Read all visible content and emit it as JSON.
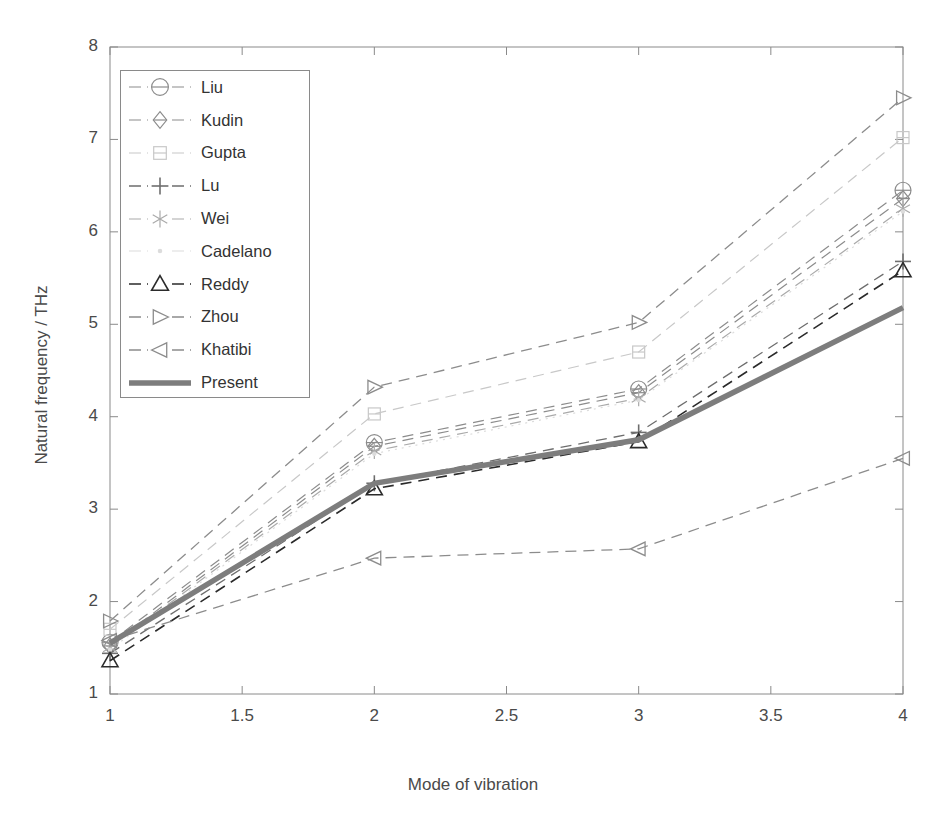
{
  "chart_data": {
    "type": "line",
    "title": "",
    "xlabel": "Mode of vibration",
    "ylabel": "Natural frequency / THz",
    "x": [
      1,
      2,
      3,
      4
    ],
    "xlim": [
      1,
      4
    ],
    "ylim": [
      1,
      8
    ],
    "xticks": [
      1,
      1.5,
      2,
      2.5,
      3,
      3.5,
      4
    ],
    "xticklabels": [
      "1",
      "1.5",
      "2",
      "2.5",
      "3",
      "3.5",
      "4"
    ],
    "yticks": [
      1,
      2,
      3,
      4,
      5,
      6,
      7,
      8
    ],
    "yticklabels": [
      "1",
      "2",
      "3",
      "4",
      "5",
      "6",
      "7",
      "8"
    ],
    "grid": false,
    "legend_position": "upper left",
    "series": [
      {
        "name": "Liu",
        "marker": "circle",
        "linestyle": "dashed",
        "color": "#8c8c8c",
        "linewidth": 1.2,
        "values": [
          1.56,
          3.72,
          4.3,
          6.45
        ]
      },
      {
        "name": "Kudin",
        "marker": "diamond",
        "linestyle": "dashed",
        "color": "#8c8c8c",
        "linewidth": 1.2,
        "values": [
          1.52,
          3.68,
          4.26,
          6.36
        ]
      },
      {
        "name": "Gupta",
        "marker": "square",
        "linestyle": "dashed",
        "color": "#c8c8c8",
        "linewidth": 1.2,
        "values": [
          1.7,
          4.03,
          4.7,
          7.02
        ]
      },
      {
        "name": "Lu",
        "marker": "plus",
        "linestyle": "dashed",
        "color": "#6e6e6e",
        "linewidth": 1.3,
        "values": [
          1.44,
          3.28,
          3.83,
          5.68
        ]
      },
      {
        "name": "Wei",
        "marker": "asterisk",
        "linestyle": "dashed",
        "color": "#aaaaaa",
        "linewidth": 1.2,
        "values": [
          1.5,
          3.63,
          4.2,
          6.25
        ]
      },
      {
        "name": "Cadelano",
        "marker": "dot",
        "linestyle": "dotted",
        "color": "#dcdcdc",
        "linewidth": 1.2,
        "values": [
          1.48,
          3.6,
          4.18,
          6.22
        ]
      },
      {
        "name": "Reddy",
        "marker": "triangle-up",
        "linestyle": "dashed",
        "color": "#2b2b2b",
        "linewidth": 1.6,
        "values": [
          1.36,
          3.22,
          3.73,
          5.58
        ]
      },
      {
        "name": "Zhou",
        "marker": "triangle-right",
        "linestyle": "dashed",
        "color": "#8c8c8c",
        "linewidth": 1.3,
        "values": [
          1.79,
          4.32,
          5.02,
          7.45
        ]
      },
      {
        "name": "Khatibi",
        "marker": "triangle-left",
        "linestyle": "dashed",
        "color": "#8c8c8c",
        "linewidth": 1.3,
        "values": [
          1.58,
          2.47,
          2.57,
          3.55
        ]
      },
      {
        "name": "Present",
        "marker": "none",
        "linestyle": "solid",
        "color": "#7d7d7d",
        "linewidth": 5.5,
        "values": [
          1.55,
          3.28,
          3.75,
          5.18
        ]
      }
    ]
  },
  "axes": {
    "frame_color": "#8a8a8a",
    "background": "#ffffff"
  }
}
